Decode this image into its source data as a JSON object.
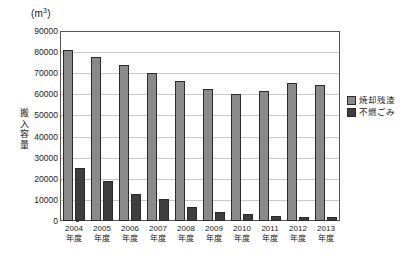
{
  "chart_data": {
    "type": "bar",
    "title": "(m3)",
    "title_base": "(m",
    "title_sup": "3",
    "title_close": ")",
    "xlabel": "",
    "ylabel": "搬入容量",
    "unit": "m3",
    "ylim": [
      0,
      90000
    ],
    "ytick_step": 10000,
    "grid": true,
    "legend_position": "right",
    "categories": [
      "2004年度",
      "2005年度",
      "2006年度",
      "2007年度",
      "2008年度",
      "2009年度",
      "2010年度",
      "2011年度",
      "2012年度",
      "2013年度"
    ],
    "category_years": [
      "2004",
      "2005",
      "2006",
      "2007",
      "2008",
      "2009",
      "2010",
      "2011",
      "2012",
      "2013"
    ],
    "category_suffix": "年度",
    "ytick_labels": [
      "90000",
      "80000",
      "70000",
      "60000",
      "50000",
      "40000",
      "30000",
      "20000",
      "10000",
      "0"
    ],
    "ytick_values": [
      90000,
      80000,
      70000,
      60000,
      50000,
      40000,
      30000,
      20000,
      10000,
      0
    ],
    "series": [
      {
        "name": "焼却残渣",
        "color": "#8a8a8a",
        "values": [
          81000,
          77500,
          74000,
          70000,
          66500,
          62500,
          60000,
          61500,
          65500,
          64500
        ]
      },
      {
        "name": "不燃ごみ",
        "color": "#3d3d3d",
        "values": [
          25000,
          19000,
          13000,
          10500,
          6800,
          4500,
          3200,
          2300,
          1700,
          1800
        ]
      }
    ]
  },
  "legend": {
    "items": [
      {
        "label": "焼却残渣",
        "color": "#8a8a8a"
      },
      {
        "label": "不燃ごみ",
        "color": "#3d3d3d"
      }
    ]
  },
  "colors": {
    "series_0": "#8a8a8a",
    "series_1": "#3d3d3d",
    "grid": "#c9c9c9",
    "axis": "#555555",
    "text": "#1a1a1a",
    "background": "#ffffff"
  }
}
